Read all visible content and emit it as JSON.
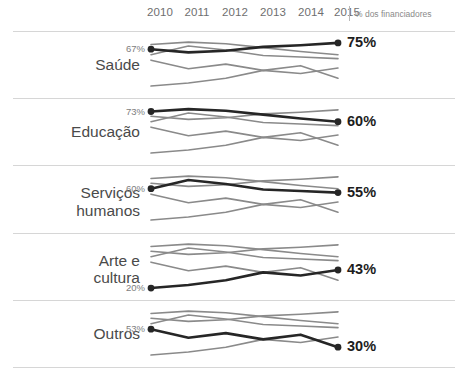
{
  "axis": {
    "years": [
      "2010",
      "2011",
      "2012",
      "2013",
      "2014",
      "2015"
    ],
    "legend_note": "% dos financiadores"
  },
  "colors": {
    "highlight": "#262626",
    "muted": "#8a8a8a",
    "rule": "#d6d6d6",
    "label": "#4a4a4a",
    "value_start": "#7d7d7d",
    "value_end": "#1d1d1d"
  },
  "chart_data": {
    "type": "line",
    "title": "",
    "subtitle": "",
    "xlabel": "",
    "ylabel": "% dos financiadores",
    "x": [
      "2010",
      "2011",
      "2012",
      "2013",
      "2014",
      "2015"
    ],
    "ylim": [
      15,
      80
    ],
    "grid": false,
    "legend_position": "none",
    "layout": "small-multiples",
    "panel_count": 5,
    "annotation": "% dos financiadores",
    "series": [
      {
        "name": "Saúde",
        "values": [
          67,
          63,
          65,
          70,
          72,
          75
        ]
      },
      {
        "name": "Educação",
        "values": [
          73,
          76,
          74,
          69,
          64,
          60
        ]
      },
      {
        "name": "Serviços humanos",
        "values": [
          60,
          71,
          66,
          59,
          57,
          55
        ]
      },
      {
        "name": "Arte e cultura",
        "values": [
          20,
          24,
          30,
          40,
          36,
          43
        ]
      },
      {
        "name": "Outros",
        "values": [
          53,
          42,
          48,
          40,
          46,
          30
        ]
      }
    ]
  },
  "panels": [
    {
      "id": "saude",
      "label": "Saúde",
      "label_lines": [
        "Saúde"
      ],
      "highlight_series": "Saúde",
      "start_value": "67%",
      "end_value": "75%"
    },
    {
      "id": "educacao",
      "label": "Educação",
      "label_lines": [
        "Educação"
      ],
      "highlight_series": "Educação",
      "start_value": "73%",
      "end_value": "60%"
    },
    {
      "id": "servicos-humanos",
      "label": "Serviços humanos",
      "label_lines": [
        "Serviços",
        "humanos"
      ],
      "highlight_series": "Serviços humanos",
      "start_value": "60%",
      "end_value": "55%"
    },
    {
      "id": "arte-e-cultura",
      "label": "Arte e cultura",
      "label_lines": [
        "Arte e",
        "cultura"
      ],
      "highlight_series": "Arte e cultura",
      "start_value": "20%",
      "end_value": "43%"
    },
    {
      "id": "outros",
      "label": "Outros",
      "label_lines": [
        "Outros"
      ],
      "highlight_series": "Outros",
      "start_value": "53%",
      "end_value": "30%"
    }
  ]
}
